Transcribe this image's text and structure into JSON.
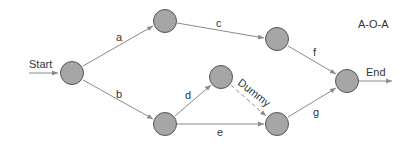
{
  "diagram": {
    "title": "A-O-A",
    "start_label": "Start",
    "end_label": "End",
    "colors": {
      "node_fill": "#a6a6a6",
      "node_stroke": "#555555",
      "edge": "#8a8a8a",
      "text": "#333333",
      "background": "#ffffff"
    },
    "nodes": [
      {
        "id": "n1",
        "x": 72,
        "y": 73
      },
      {
        "id": "n2",
        "x": 165,
        "y": 21
      },
      {
        "id": "n3",
        "x": 165,
        "y": 124
      },
      {
        "id": "n4",
        "x": 221,
        "y": 77
      },
      {
        "id": "n5",
        "x": 277,
        "y": 39
      },
      {
        "id": "n6",
        "x": 277,
        "y": 124
      },
      {
        "id": "n7",
        "x": 347,
        "y": 81
      }
    ],
    "edges": [
      {
        "label": "a",
        "from": "n1",
        "to": "n2",
        "dashed": false
      },
      {
        "label": "b",
        "from": "n1",
        "to": "n3",
        "dashed": false
      },
      {
        "label": "c",
        "from": "n2",
        "to": "n5",
        "dashed": false
      },
      {
        "label": "d",
        "from": "n3",
        "to": "n4",
        "dashed": false
      },
      {
        "label": "e",
        "from": "n3",
        "to": "n6",
        "dashed": false
      },
      {
        "label": "Dummy",
        "from": "n4",
        "to": "n6",
        "dashed": true
      },
      {
        "label": "f",
        "from": "n5",
        "to": "n7",
        "dashed": false
      },
      {
        "label": "g",
        "from": "n6",
        "to": "n7",
        "dashed": false
      }
    ]
  }
}
